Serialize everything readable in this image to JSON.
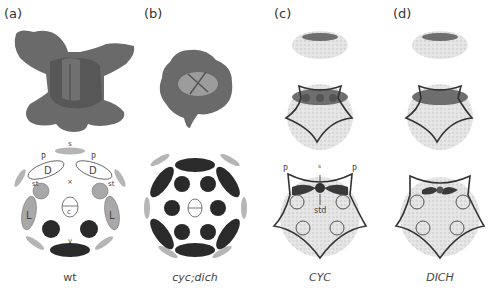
{
  "panels": [
    {
      "id": "a",
      "label": "(a)",
      "caption": "wt",
      "caption_italic": false
    },
    {
      "id": "b",
      "label": "(b)",
      "caption": "cyc;dich",
      "caption_italic": true
    },
    {
      "id": "c",
      "label": "(c)",
      "caption": "CYC",
      "caption_italic": true
    },
    {
      "id": "d",
      "label": "(d)",
      "caption": "DICH",
      "caption_italic": true
    }
  ],
  "diagram_labels": {
    "sepal": "s",
    "petal": "P",
    "dorsal": "D",
    "stamen": "st",
    "lateral": "L",
    "ventral": "v",
    "carpel": "c",
    "axis": "×",
    "staminode": "std"
  },
  "colors": {
    "flower_photo": "#6b6b6b",
    "sepal": "#b5b5b5",
    "stamen_gray": "#a8a8a8",
    "ventral_dark": "#2a2a2a",
    "expression": "#6e6e6e",
    "stipple": "#dcdcdc"
  }
}
